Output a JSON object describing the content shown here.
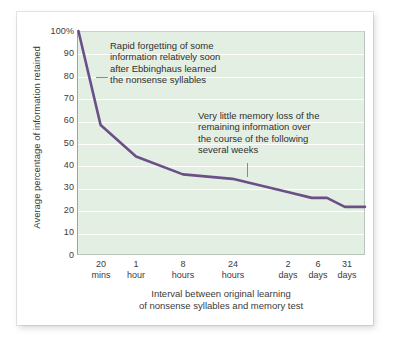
{
  "chart_data": {
    "type": "line",
    "title": "",
    "xlabel": "Interval between original learning of nonsense syllables and memory test",
    "ylabel": "Average percentage of information retained",
    "ylim": [
      0,
      100
    ],
    "yticks": [
      "100%",
      "90",
      "80",
      "70",
      "60",
      "50",
      "40",
      "30",
      "20",
      "10",
      "0"
    ],
    "ytick_values": [
      100,
      90,
      80,
      70,
      60,
      50,
      40,
      30,
      20,
      10,
      0
    ],
    "grid": true,
    "legend": "none",
    "categories": [
      "20 mins",
      "1 hour",
      "8 hours",
      "24 hours",
      "2 days",
      "6 days",
      "31 days"
    ],
    "xticks": [
      {
        "value": "20",
        "unit": "mins"
      },
      {
        "value": "1",
        "unit": "hour"
      },
      {
        "value": "8",
        "unit": "hours"
      },
      {
        "value": "24",
        "unit": "hours"
      },
      {
        "value": "2",
        "unit": "days"
      },
      {
        "value": "6",
        "unit": "days"
      },
      {
        "value": "31",
        "unit": "days"
      }
    ],
    "series": [
      {
        "name": "Retention",
        "color": "#6b4f87",
        "points": [
          {
            "x_label": "0 mins",
            "y": 100
          },
          {
            "x_label": "20 mins",
            "y": 58
          },
          {
            "x_label": "1 hour",
            "y": 44
          },
          {
            "x_label": "8 hours",
            "y": 36
          },
          {
            "x_label": "24 hours",
            "y": 34
          },
          {
            "x_label": "2 days",
            "y": 28
          },
          {
            "x_label": "4 days",
            "y": 25.5
          },
          {
            "x_label": "6 days",
            "y": 25.5
          },
          {
            "x_label": "15 days",
            "y": 21.5
          },
          {
            "x_label": "31 days",
            "y": 21.5
          }
        ]
      }
    ],
    "annotations": [
      {
        "id": "rapid-forgetting",
        "lines": [
          "Rapid forgetting of some",
          "information relatively soon",
          "after Ebbinghaus learned",
          "the nonsense syllables"
        ]
      },
      {
        "id": "little-memory-loss",
        "lines": [
          "Very little memory loss of the",
          "remaining information over",
          "the course of the following",
          "several weeks"
        ]
      }
    ],
    "colors": {
      "plot_background": "#e4efe4",
      "gridline": "#ffffff",
      "curve": "#6b4f87",
      "text": "#3b3b3b",
      "page_background": "#ffffff"
    }
  },
  "xlabel_lines": [
    "Interval between original learning",
    "of nonsense syllables and memory test"
  ]
}
